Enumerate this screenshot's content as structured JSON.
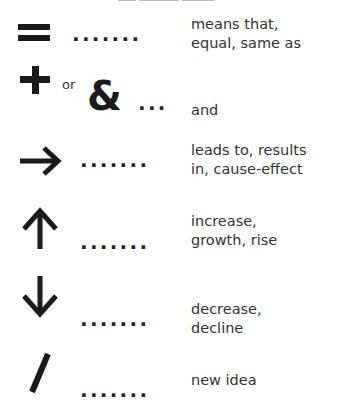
{
  "title": "",
  "legend": [
    {
      "symbol": "=",
      "symbol_name": "equals-icon",
      "dots": ".......",
      "meaning_lines": [
        "means that,",
        "equal, same as"
      ]
    },
    {
      "symbol": "+",
      "symbol_alt_connector": "or",
      "symbol_alt": "&",
      "symbol_name": "plus-icon",
      "dots": "...",
      "meaning_lines": [
        "and"
      ]
    },
    {
      "symbol": "→",
      "symbol_name": "arrow-right-icon",
      "dots": ".......",
      "meaning_lines": [
        "leads to, results",
        "in, cause-effect"
      ]
    },
    {
      "symbol": "↑",
      "symbol_name": "arrow-up-icon",
      "dots": ".......",
      "meaning_lines": [
        "increase,",
        "growth, rise"
      ]
    },
    {
      "symbol": "↓",
      "symbol_name": "arrow-down-icon",
      "dots": ".......",
      "meaning_lines": [
        "decrease,",
        "decline"
      ]
    },
    {
      "symbol": "/",
      "symbol_name": "slash-icon",
      "dots": ".......",
      "meaning_lines": [
        "new idea"
      ]
    }
  ]
}
